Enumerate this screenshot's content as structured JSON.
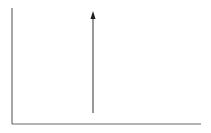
{
  "diagram": {
    "type": "impulse-plot",
    "colors": {
      "background": "#ffffff",
      "axis": "#6a6a6a",
      "impulse_line": "#555555",
      "arrowhead": "#1e1e1e"
    },
    "axes": {
      "y_axis": {
        "x": 12,
        "y_top": 8,
        "y_bottom": 124
      },
      "x_axis": {
        "y": 124,
        "x_left": 12,
        "x_right": 201
      }
    },
    "impulse": {
      "x": 93,
      "y_base": 113,
      "y_tip": 11
    },
    "labels": []
  }
}
